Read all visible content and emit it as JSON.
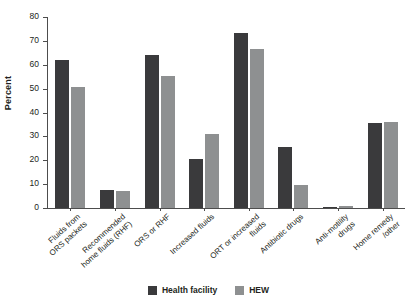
{
  "chart_data": {
    "type": "bar",
    "title": "",
    "subtitle": "",
    "xlabel": "",
    "ylabel": "Percent",
    "ylim": [
      0,
      80
    ],
    "ytick_step": 10,
    "yticks": [
      0,
      10,
      20,
      30,
      40,
      50,
      60,
      70,
      80
    ],
    "ytick_labels": [
      "0",
      "10",
      "20",
      "30",
      "40",
      "50",
      "60",
      "70",
      "80"
    ],
    "grid": false,
    "legend_position": "bottom",
    "categories": [
      "Fluids from\nORS packets",
      "Recommended\nhome fluids (RHF)",
      "ORS or RHF",
      "Increased fluids",
      "ORT or increased\nfluids",
      "Antibiotic drugs",
      "Anti-motility\ndrugs",
      "Home remedy\n/other"
    ],
    "series": [
      {
        "name": "Health facility",
        "color": "#3a3a3c",
        "values": [
          62.0,
          7.5,
          64.0,
          20.5,
          73.5,
          25.5,
          0.6,
          35.5
        ]
      },
      {
        "name": "HEW",
        "color": "#8e9091",
        "values": [
          50.5,
          7.0,
          55.5,
          31.0,
          66.5,
          9.5,
          0.8,
          36.0
        ]
      }
    ],
    "annotations": []
  },
  "legend": {
    "entries": [
      {
        "label": "Health facility",
        "swatch": "dark-swatch"
      },
      {
        "label": "HEW",
        "swatch": "light-swatch"
      }
    ]
  }
}
